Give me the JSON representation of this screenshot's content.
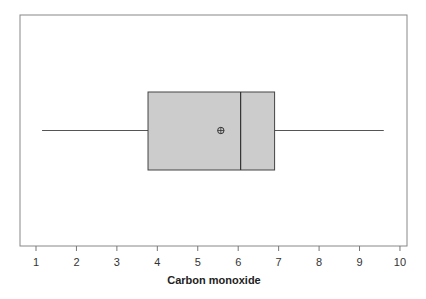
{
  "chart_data": {
    "type": "boxplot",
    "title": "",
    "xlabel": "Carbon monoxide",
    "ylabel": "",
    "xlim": [
      0.6,
      10.2
    ],
    "xticks": [
      1,
      2,
      3,
      4,
      5,
      6,
      7,
      8,
      9,
      10
    ],
    "orientation": "horizontal",
    "grid": false,
    "series": [
      {
        "name": "Carbon monoxide",
        "whisker_low": 1.15,
        "q1": 3.77,
        "median": 6.06,
        "q3": 6.9,
        "whisker_high": 9.6,
        "mean": 5.57
      }
    ],
    "box_color": "#cccccc",
    "line_color": "#333333"
  },
  "axis": {
    "title": "Carbon monoxide",
    "tick_labels": [
      "1",
      "2",
      "3",
      "4",
      "5",
      "6",
      "7",
      "8",
      "9",
      "10"
    ]
  }
}
